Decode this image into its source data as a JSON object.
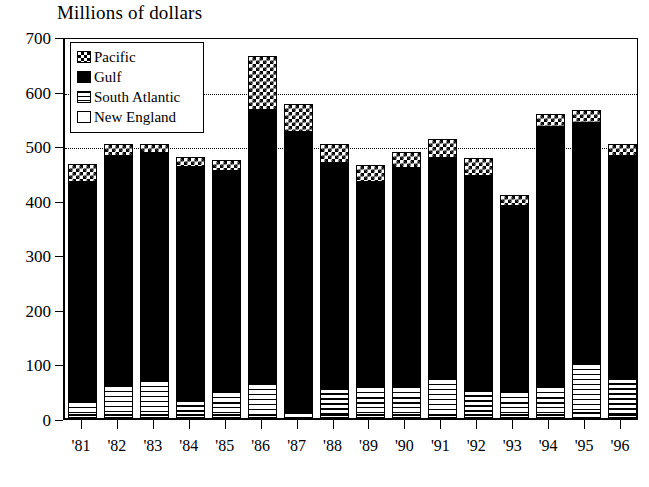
{
  "chart_data": {
    "type": "bar",
    "subtype": "stacked-vertical",
    "title": "Millions of dollars",
    "xlabel": "",
    "ylabel": "Millions of dollars",
    "ylim": [
      0,
      700
    ],
    "yticks": [
      0,
      100,
      200,
      300,
      400,
      500,
      600,
      700
    ],
    "ytick_labels": [
      "0",
      "100",
      "200",
      "300",
      "400",
      "500",
      "600",
      "700"
    ],
    "grid": "horizontal-dotted",
    "gridlines_at": [
      500,
      600
    ],
    "legend_position": "upper-left-inside",
    "categories": [
      "'81",
      "'82",
      "'83",
      "'84",
      "'85",
      "'86",
      "'87",
      "'88",
      "'89",
      "'90",
      "'91",
      "'92",
      "'93",
      "'94",
      "'95",
      "'96"
    ],
    "stack_order_bottom_to_top": [
      "New England",
      "South Atlantic",
      "Gulf",
      "Pacific"
    ],
    "series": [
      {
        "name": "New England",
        "pattern": "open-white",
        "values": [
          6,
          6,
          6,
          6,
          5,
          5,
          10,
          5,
          5,
          5,
          6,
          5,
          5,
          6,
          10,
          6
        ]
      },
      {
        "name": "South Atlantic",
        "pattern": "horizontal-lines",
        "values": [
          26,
          55,
          64,
          29,
          45,
          60,
          6,
          52,
          53,
          53,
          67,
          48,
          44,
          52,
          90,
          69
        ]
      },
      {
        "name": "Gulf",
        "pattern": "solid-black",
        "values": [
          400,
          420,
          415,
          425,
          403,
          500,
          508,
          410,
          375,
          400,
          404,
          390,
          339,
          476,
          441,
          406
        ]
      },
      {
        "name": "Pacific",
        "pattern": "checkerboard",
        "values": [
          33,
          21,
          17,
          18,
          19,
          98,
          52,
          36,
          30,
          29,
          34,
          33,
          20,
          24,
          24,
          22
        ]
      }
    ],
    "totals": [
      465,
      502,
      502,
      478,
      472,
      663,
      576,
      503,
      463,
      487,
      511,
      476,
      408,
      558,
      565,
      503
    ]
  },
  "legend": {
    "items": [
      {
        "label": "Pacific",
        "key": "pacific"
      },
      {
        "label": "Gulf",
        "key": "gulf"
      },
      {
        "label": "South Atlantic",
        "key": "south-atlantic"
      },
      {
        "label": "New England",
        "key": "new-england"
      }
    ]
  },
  "colors": {
    "ink": "#000000",
    "paper": "#ffffff"
  }
}
